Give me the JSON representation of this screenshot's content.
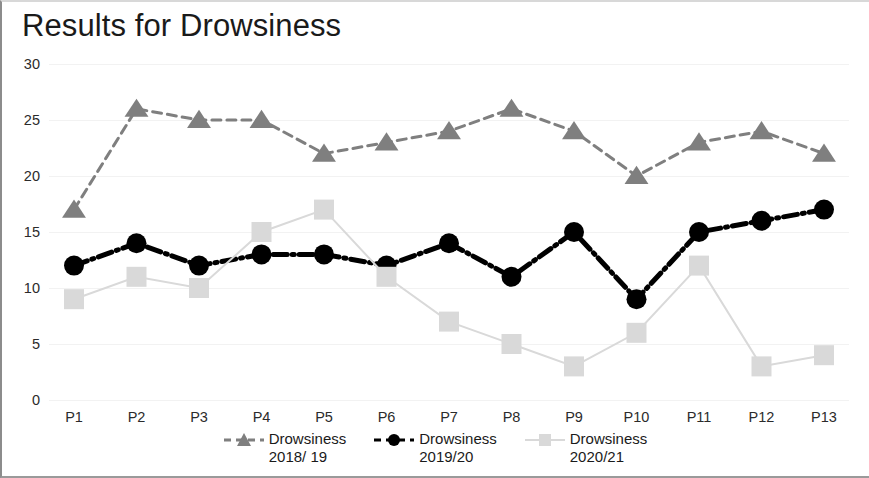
{
  "title": "Results for Drowsiness",
  "chart_data": {
    "type": "line",
    "title": "Results for Drowsiness",
    "xlabel": "",
    "ylabel": "",
    "categories": [
      "P1",
      "P2",
      "P3",
      "P4",
      "P5",
      "P6",
      "P7",
      "P8",
      "P9",
      "P10",
      "P11",
      "P12",
      "P13"
    ],
    "ylim": [
      0,
      30
    ],
    "yticks": [
      0,
      5,
      10,
      15,
      20,
      25,
      30
    ],
    "grid": true,
    "legend_position": "bottom",
    "series": [
      {
        "name": "Drowsiness\n2018/ 19",
        "values": [
          17,
          26,
          25,
          25,
          22,
          23,
          24,
          26,
          24,
          20,
          23,
          24,
          22
        ],
        "color": "#7f7f7f",
        "marker": "triangle",
        "linestyle": "dashed"
      },
      {
        "name": "Drowsiness\n2019/20",
        "values": [
          12,
          14,
          12,
          13,
          13,
          12,
          14,
          11,
          15,
          9,
          15,
          16,
          17
        ],
        "color": "#000000",
        "marker": "circle",
        "linestyle": "dashdot"
      },
      {
        "name": "Drowsiness\n2020/21",
        "values": [
          9,
          11,
          10,
          15,
          17,
          11,
          7,
          5,
          3,
          6,
          12,
          3,
          4
        ],
        "color": "#d9d9d9",
        "marker": "square",
        "linestyle": "solid"
      }
    ]
  }
}
